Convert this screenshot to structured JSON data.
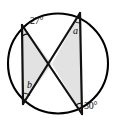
{
  "figure": {
    "name": "circle-with-two-intersecting-chord-pairs",
    "canvas": {
      "width": 121,
      "height": 128,
      "background": "#ffffff"
    },
    "colors": {
      "stroke": "#111111",
      "circle_stroke": "#000000",
      "shade_fill": "#e2e2e2",
      "text": "#0a0a0a"
    },
    "circle": {
      "cx": 58,
      "cy": 63.5,
      "r": 50,
      "stroke_width": 2
    },
    "points": {
      "A": {
        "label": "A",
        "x": 22,
        "y": 25
      },
      "B": {
        "label": "B",
        "x": 80,
        "y": 13
      },
      "C": {
        "label": "C",
        "x": 23,
        "y": 104
      },
      "D": {
        "label": "D",
        "x": 82,
        "y": 114
      },
      "X": {
        "label": "X",
        "x": 52,
        "y": 64
      }
    },
    "chords": [
      {
        "name": "chord-A-C",
        "from": "A",
        "to": "C",
        "stroke_width": 2
      },
      {
        "name": "chord-B-D",
        "from": "B",
        "to": "D",
        "stroke_width": 2
      },
      {
        "name": "chord-A-D",
        "from": "A",
        "to": "D",
        "stroke_width": 2
      },
      {
        "name": "chord-B-C",
        "from": "B",
        "to": "C",
        "stroke_width": 2
      }
    ],
    "shaded_triangles": [
      {
        "name": "shaded-triangle-left",
        "vertices": [
          "A",
          "C",
          "X"
        ]
      },
      {
        "name": "shaded-triangle-right",
        "vertices": [
          "B",
          "D",
          "X"
        ]
      }
    ],
    "angle_arcs": [
      {
        "name": "angle-arc-27",
        "at": "A",
        "radius": 11
      },
      {
        "name": "angle-arc-a",
        "at": "B",
        "radius": 10
      },
      {
        "name": "angle-arc-b",
        "at": "C",
        "radius": 11
      },
      {
        "name": "angle-arc-30",
        "at": "D",
        "radius": 11
      }
    ]
  },
  "labels": {
    "top_left_angle": "27°",
    "top_right_angle": "a",
    "bottom_left_angle": "b",
    "bottom_right_angle": "30°"
  }
}
